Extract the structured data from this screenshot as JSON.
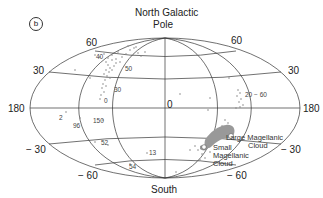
{
  "figure": {
    "panel_label": "b",
    "title_line1": "North Galactic",
    "title_line2": "Pole",
    "bottom_label": "South",
    "projection": "Aitoff (galactic coordinates)",
    "line_color": "#333333",
    "point_color": "#888888"
  },
  "axis_labels": {
    "lat_60_left": "60",
    "lat_60_right": "60",
    "lat_30_left": "30",
    "lat_30_right": "30",
    "lon_180_left": "180",
    "lon_180_right": "180",
    "lon_0_center": "0",
    "lat_m30_left": "− 30",
    "lat_m30_right": "− 30",
    "lat_m60_left": "− 60",
    "lat_m60_right": "− 60"
  },
  "annotations": {
    "a40": "40",
    "a50": "50",
    "a30": "30",
    "a0": "0",
    "a2": "2",
    "a96": "96",
    "a150": "150",
    "a52": "52",
    "a13": "13",
    "a54": "54",
    "a20_60": "20 − 60",
    "lmc_line1": "Large Magellanic",
    "lmc_line2": "Cloud",
    "smc_line1": "Small",
    "smc_line2": "Magellanic",
    "smc_line3": "Cloud"
  }
}
